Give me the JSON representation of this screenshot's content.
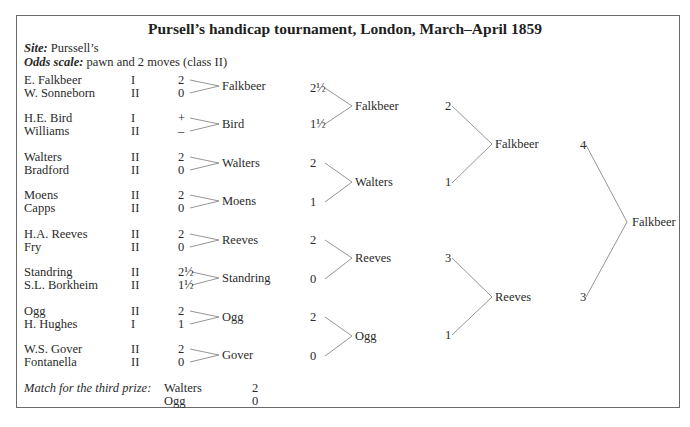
{
  "title": "Pursell’s handicap tournament, London, March–April 1859",
  "site_label": "Site:",
  "site_value": " Purssell’s",
  "odds_label": "Odds scale:",
  "odds_value": " pawn and 2 moves (class II)",
  "round1": [
    {
      "p1": "E. Falkbeer",
      "c1": "I",
      "s1": "2",
      "p2": "W. Sonneborn",
      "c2": "II",
      "s2": "0",
      "winner": "Falkbeer"
    },
    {
      "p1": "H.E. Bird",
      "c1": "I",
      "s1": "+",
      "p2": "Williams",
      "c2": "II",
      "s2": "–",
      "winner": "Bird"
    },
    {
      "p1": "Walters",
      "c1": "II",
      "s1": "2",
      "p2": "Bradford",
      "c2": "II",
      "s2": "0",
      "winner": "Walters"
    },
    {
      "p1": "Moens",
      "c1": "II",
      "s1": "2",
      "p2": "Capps",
      "c2": "II",
      "s2": "0",
      "winner": "Moens"
    },
    {
      "p1": "H.A. Reeves",
      "c1": "II",
      "s1": "2",
      "p2": "Fry",
      "c2": "II",
      "s2": "0",
      "winner": "Reeves"
    },
    {
      "p1": "Standring",
      "c1": "II",
      "s1": "2½",
      "p2": "S.L. Borkheim",
      "c2": "II",
      "s2": "1½",
      "winner": "Standring"
    },
    {
      "p1": "Ogg",
      "c1": "II",
      "s1": "2",
      "p2": "H. Hughes",
      "c2": "I",
      "s2": "1",
      "winner": "Ogg"
    },
    {
      "p1": "W.S. Gover",
      "c1": "II",
      "s1": "2",
      "p2": "Fontanella",
      "c2": "II",
      "s2": "0",
      "winner": "Gover"
    }
  ],
  "round2": [
    {
      "s1": "2½",
      "s2": "1½",
      "winner": "Falkbeer"
    },
    {
      "s1": "2",
      "s2": "1",
      "winner": "Walters"
    },
    {
      "s1": "2",
      "s2": "0",
      "winner": "Reeves"
    },
    {
      "s1": "2",
      "s2": "0",
      "winner": "Ogg"
    }
  ],
  "round3": [
    {
      "s1": "2",
      "s2": "1",
      "winner": "Falkbeer"
    },
    {
      "s1": "3",
      "s2": "1",
      "winner": "Reeves"
    }
  ],
  "final": {
    "s1": "4",
    "s2": "3",
    "winner": "Falkbeer"
  },
  "third_prize": {
    "label": "Match for the third prize:",
    "p1": "Walters",
    "s1": "2",
    "p2": "Ogg",
    "s2": "0"
  }
}
